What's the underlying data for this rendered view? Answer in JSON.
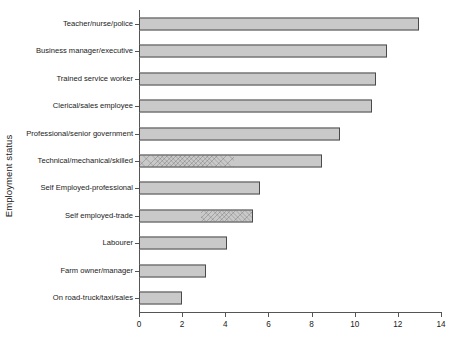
{
  "chart_data": {
    "type": "bar",
    "orientation": "horizontal",
    "title": "",
    "xlabel": "",
    "ylabel": "Employment status",
    "xlim": [
      0,
      14
    ],
    "xticks": [
      0,
      2,
      4,
      6,
      8,
      10,
      12,
      14
    ],
    "xtick_labels": [
      "0",
      "2",
      "4",
      "6",
      "8",
      "10",
      "12",
      "14"
    ],
    "grid": false,
    "legend": "none",
    "categories": [
      "Teacher/nurse/police",
      "Business manager/executive",
      "Trained service worker",
      "Clerical/sales employee",
      "Professional/senior government",
      "Technical/mechanical/skilled",
      "Self Employed-professional",
      "Self employed-trade",
      "Labourer",
      "Farm owner/manager",
      "On road-truck/taxi/sales"
    ],
    "values": [
      13.0,
      11.5,
      11.0,
      10.8,
      9.3,
      8.5,
      5.6,
      5.3,
      4.1,
      3.1,
      2.0
    ],
    "bar_fill_color": "#c9c9c9",
    "bar_edge_color": "#4a4a4a",
    "hatched_bars": [
      "Technical/mechanical/skilled",
      "Self employed-trade"
    ]
  },
  "axis": {
    "y_title": "Employment status",
    "x_title": ""
  }
}
